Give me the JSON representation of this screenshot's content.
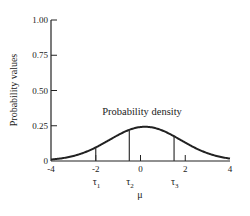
{
  "chart_data": {
    "type": "line",
    "title": "",
    "xlabel": "μ",
    "ylabel": "Probability values",
    "xlim": [
      -4,
      4
    ],
    "ylim": [
      0,
      1.0
    ],
    "x_ticks": [
      "-4",
      "-2",
      "0",
      "2",
      "4"
    ],
    "y_ticks": [
      "0",
      "0.25",
      "0.50",
      "0.75",
      "1.00"
    ],
    "grid": false,
    "series": [
      {
        "name": "Probability density",
        "distribution": "normal",
        "mean": 0.2,
        "sd": 1.6,
        "peak": 0.24,
        "x": [
          -4,
          -3,
          -2,
          -1,
          0,
          0.2,
          1,
          2,
          3,
          4
        ],
        "y": [
          0.02,
          0.05,
          0.09,
          0.18,
          0.24,
          0.24,
          0.21,
          0.13,
          0.06,
          0.02
        ]
      }
    ],
    "annotations": [
      {
        "text": "Probability density",
        "x": -1.2,
        "y": 0.3
      },
      {
        "text": "τ1",
        "x": -2.0,
        "type": "vertical-line"
      },
      {
        "text": "τ2",
        "x": -0.5,
        "type": "vertical-line"
      },
      {
        "text": "τ3",
        "x": 1.5,
        "type": "vertical-line"
      }
    ],
    "thresholds": [
      {
        "label": "τ",
        "sub": "1",
        "x": -2.0
      },
      {
        "label": "τ",
        "sub": "2",
        "x": -0.5
      },
      {
        "label": "τ",
        "sub": "3",
        "x": 1.5
      }
    ]
  }
}
